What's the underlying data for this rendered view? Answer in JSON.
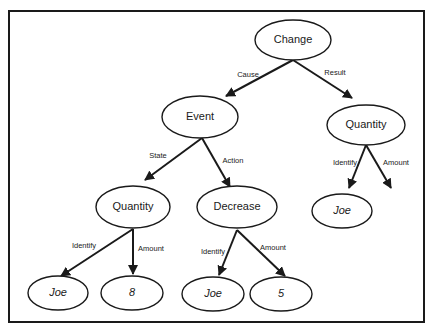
{
  "diagram": {
    "type": "tree",
    "colors": {
      "stroke": "#1a1a1a",
      "background": "#ffffff"
    },
    "nodes": [
      {
        "id": "change",
        "label": "Change",
        "italic": false
      },
      {
        "id": "event",
        "label": "Event",
        "italic": false
      },
      {
        "id": "quantity_result",
        "label": "Quantity",
        "italic": false
      },
      {
        "id": "joe_result",
        "label": "Joe",
        "italic": true
      },
      {
        "id": "quantity_state",
        "label": "Quantity",
        "italic": false
      },
      {
        "id": "decrease",
        "label": "Decrease",
        "italic": false
      },
      {
        "id": "joe_state",
        "label": "Joe",
        "italic": true
      },
      {
        "id": "eight",
        "label": "8",
        "italic": true
      },
      {
        "id": "joe_action",
        "label": "Joe",
        "italic": true
      },
      {
        "id": "five",
        "label": "5",
        "italic": true
      }
    ],
    "edges": [
      {
        "from": "change",
        "to": "event",
        "label": "Cause"
      },
      {
        "from": "change",
        "to": "quantity_result",
        "label": "Result"
      },
      {
        "from": "event",
        "to": "quantity_state",
        "label": "State"
      },
      {
        "from": "event",
        "to": "decrease",
        "label": "Action"
      },
      {
        "from": "quantity_result",
        "to": "joe_result",
        "label": "Identify"
      },
      {
        "from": "quantity_result",
        "to": "(none)",
        "label": "Amount"
      },
      {
        "from": "quantity_state",
        "to": "joe_state",
        "label": "Identify"
      },
      {
        "from": "quantity_state",
        "to": "eight",
        "label": "Amount"
      },
      {
        "from": "decrease",
        "to": "joe_action",
        "label": "Identify"
      },
      {
        "from": "decrease",
        "to": "five",
        "label": "Amount"
      }
    ]
  }
}
